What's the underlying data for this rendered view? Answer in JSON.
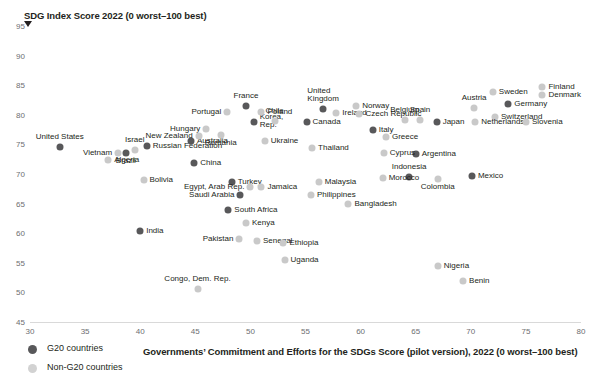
{
  "chart_data": {
    "type": "scatter",
    "title": "",
    "ylabel": "SDG Index Score 2022 (0 worst–100 best)",
    "xlabel": "Governments’ Commitment and Efforts for the SDGs Score (pilot version), 2022 (0 worst–100 best)",
    "xlim": [
      30,
      80
    ],
    "ylim": [
      45,
      95
    ],
    "xticks": [
      30,
      35,
      40,
      45,
      50,
      55,
      60,
      65,
      70,
      75,
      80
    ],
    "yticks": [
      45,
      50,
      55,
      60,
      65,
      70,
      75,
      80,
      85,
      90,
      95
    ],
    "grid": false,
    "legend_position": "bottom-left",
    "series": [
      {
        "name": "G20 countries",
        "color": "#58585a",
        "points": [
          {
            "label": "United States",
            "x": 32.7,
            "y": 74.6,
            "lp": "above-center"
          },
          {
            "label": "Brazil",
            "x": 38.7,
            "y": 73.5,
            "lp": "below-center"
          },
          {
            "label": "Russian Federation",
            "x": 40.6,
            "y": 74.7,
            "lp": "right"
          },
          {
            "label": "India",
            "x": 40.0,
            "y": 60.3,
            "lp": "right"
          },
          {
            "label": "Australia",
            "x": 44.6,
            "y": 75.6,
            "lp": "right"
          },
          {
            "label": "China",
            "x": 44.9,
            "y": 71.8,
            "lp": "right"
          },
          {
            "label": "South Africa",
            "x": 48.0,
            "y": 64.0,
            "lp": "right"
          },
          {
            "label": "Turkey",
            "x": 48.3,
            "y": 68.6,
            "lp": "right"
          },
          {
            "label": "Saudi Arabia",
            "x": 49.1,
            "y": 66.5,
            "lp": "left"
          },
          {
            "label": "France",
            "x": 49.6,
            "y": 81.5,
            "lp": "above-center"
          },
          {
            "label": "Korea, Rep.",
            "x": 50.3,
            "y": 78.8,
            "lp": "right2"
          },
          {
            "label": "Canada",
            "x": 55.1,
            "y": 78.7,
            "lp": "right"
          },
          {
            "label": "United Kingdom",
            "x": 56.6,
            "y": 81.0,
            "lp": "above-center2"
          },
          {
            "label": "Italy",
            "x": 61.1,
            "y": 77.4,
            "lp": "right"
          },
          {
            "label": "Japan",
            "x": 66.9,
            "y": 78.8,
            "lp": "right"
          },
          {
            "label": "Argentina",
            "x": 65.0,
            "y": 73.3,
            "lp": "right"
          },
          {
            "label": "Indonesia",
            "x": 64.4,
            "y": 69.5,
            "lp": "above-center"
          },
          {
            "label": "Mexico",
            "x": 70.1,
            "y": 69.7,
            "lp": "right"
          },
          {
            "label": "Germany",
            "x": 73.4,
            "y": 81.9,
            "lp": "right"
          }
        ]
      },
      {
        "name": "Non-G20 countries",
        "color": "#c9c9c9",
        "points": [
          {
            "label": "Vietnam",
            "x": 38.0,
            "y": 73.5,
            "lp": "left"
          },
          {
            "label": "Algeria",
            "x": 37.1,
            "y": 72.4,
            "lp": "right"
          },
          {
            "label": "Israel",
            "x": 39.5,
            "y": 74.1,
            "lp": "above-center"
          },
          {
            "label": "Bolivia",
            "x": 40.3,
            "y": 69.0,
            "lp": "right"
          },
          {
            "label": "Hungary",
            "x": 46.0,
            "y": 77.6,
            "lp": "left"
          },
          {
            "label": "New Zealand",
            "x": 45.3,
            "y": 76.5,
            "lp": "left"
          },
          {
            "label": "Romania",
            "x": 47.3,
            "y": 76.6,
            "lp": "below-center"
          },
          {
            "label": "Portugal",
            "x": 47.9,
            "y": 80.4,
            "lp": "left"
          },
          {
            "label": "Poland",
            "x": 51.0,
            "y": 80.4,
            "lp": "right"
          },
          {
            "label": "Chile",
            "x": 52.2,
            "y": 78.9,
            "lp": "above-center"
          },
          {
            "label": "Ukraine",
            "x": 51.3,
            "y": 75.5,
            "lp": "right"
          },
          {
            "label": "Thailand",
            "x": 55.6,
            "y": 74.4,
            "lp": "right"
          },
          {
            "label": "Egypt, Arab Rep.",
            "x": 50.0,
            "y": 67.8,
            "lp": "left"
          },
          {
            "label": "Jamaica",
            "x": 51.0,
            "y": 67.8,
            "lp": "right"
          },
          {
            "label": "Malaysia",
            "x": 56.2,
            "y": 68.6,
            "lp": "right"
          },
          {
            "label": "Philippines",
            "x": 55.5,
            "y": 66.4,
            "lp": "right"
          },
          {
            "label": "Kenya",
            "x": 49.6,
            "y": 61.8,
            "lp": "right"
          },
          {
            "label": "Pakistan",
            "x": 49.0,
            "y": 59.0,
            "lp": "left"
          },
          {
            "label": "Senegal",
            "x": 50.6,
            "y": 58.7,
            "lp": "right"
          },
          {
            "label": "Ethiopia",
            "x": 53.0,
            "y": 58.4,
            "lp": "right"
          },
          {
            "label": "Uganda",
            "x": 53.1,
            "y": 55.4,
            "lp": "right"
          },
          {
            "label": "Congo, Dem. Rep.",
            "x": 45.2,
            "y": 50.6,
            "lp": "above-center"
          },
          {
            "label": "Ireland",
            "x": 57.8,
            "y": 80.3,
            "lp": "right"
          },
          {
            "label": "Norway",
            "x": 59.6,
            "y": 81.5,
            "lp": "right"
          },
          {
            "label": "Czech Republic",
            "x": 59.9,
            "y": 80.2,
            "lp": "right"
          },
          {
            "label": "Greece",
            "x": 62.3,
            "y": 76.2,
            "lp": "right"
          },
          {
            "label": "Belgium",
            "x": 64.0,
            "y": 79.1,
            "lp": "above-center"
          },
          {
            "label": "Spain",
            "x": 65.4,
            "y": 79.2,
            "lp": "above-center"
          },
          {
            "label": "Cyprus",
            "x": 62.1,
            "y": 73.6,
            "lp": "right"
          },
          {
            "label": "Morocco",
            "x": 62.0,
            "y": 69.4,
            "lp": "right"
          },
          {
            "label": "Colombia",
            "x": 67.0,
            "y": 69.1,
            "lp": "below-center"
          },
          {
            "label": "Bangladesh",
            "x": 58.9,
            "y": 65.0,
            "lp": "right"
          },
          {
            "label": "Nigeria",
            "x": 67.0,
            "y": 54.4,
            "lp": "right"
          },
          {
            "label": "Benin",
            "x": 69.3,
            "y": 51.9,
            "lp": "right"
          },
          {
            "label": "Austria",
            "x": 70.3,
            "y": 81.2,
            "lp": "above-center"
          },
          {
            "label": "Sweden",
            "x": 72.0,
            "y": 83.8,
            "lp": "right"
          },
          {
            "label": "Switzerland",
            "x": 72.2,
            "y": 79.6,
            "lp": "right"
          },
          {
            "label": "Netherlands",
            "x": 70.4,
            "y": 78.8,
            "lp": "right"
          },
          {
            "label": "Slovenia",
            "x": 75.0,
            "y": 78.7,
            "lp": "right"
          },
          {
            "label": "Finland",
            "x": 76.5,
            "y": 84.7,
            "lp": "right"
          },
          {
            "label": "Denmark",
            "x": 76.5,
            "y": 83.4,
            "lp": "right"
          }
        ]
      }
    ]
  },
  "legend": {
    "items": [
      {
        "label": "G20 countries",
        "kind": "g20"
      },
      {
        "label": "Non-G20 countries",
        "kind": "non"
      }
    ]
  }
}
